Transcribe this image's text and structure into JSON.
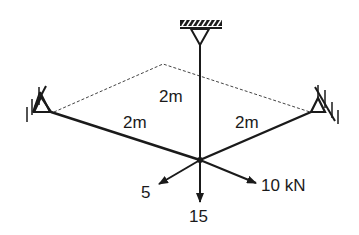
{
  "diagram": {
    "type": "space-truss-tripod",
    "members": [
      {
        "name": "left-member",
        "length_label": "2m"
      },
      {
        "name": "right-member",
        "length_label": "2m"
      },
      {
        "name": "vertical-member",
        "length_label": "2m"
      }
    ],
    "supports": [
      "top-fixed-pin",
      "left-pin",
      "right-pin"
    ],
    "loads": [
      {
        "name": "load-left",
        "label": "5"
      },
      {
        "name": "load-down",
        "label": "15"
      },
      {
        "name": "load-right",
        "label": "10 kN"
      }
    ],
    "colors": {
      "stroke": "#1a1a1a",
      "background": "#ffffff"
    }
  }
}
